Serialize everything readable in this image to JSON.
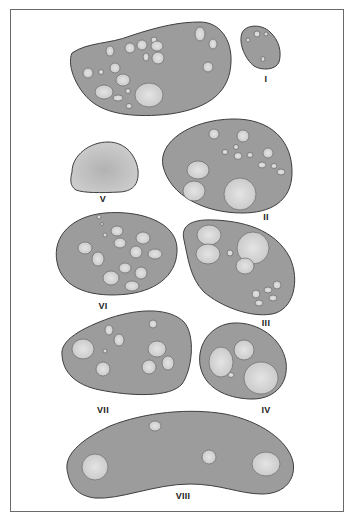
{
  "figure": {
    "type": "cross-section illustration",
    "colors": {
      "section_fill": "#9c9c9c",
      "hole_fill": "#d2d2d2",
      "hole_highlight": "#e6e6e6",
      "outline": "#3f3f3f",
      "frame": "#6a6a6a"
    },
    "sections": [
      {
        "id": "top",
        "label": ""
      },
      {
        "id": "I",
        "label": "I"
      },
      {
        "id": "II",
        "label": "II"
      },
      {
        "id": "III",
        "label": "III"
      },
      {
        "id": "IV",
        "label": "IV"
      },
      {
        "id": "V",
        "label": "V"
      },
      {
        "id": "VI",
        "label": "VI"
      },
      {
        "id": "VII",
        "label": "VII"
      },
      {
        "id": "VIII",
        "label": "VIII"
      }
    ]
  }
}
